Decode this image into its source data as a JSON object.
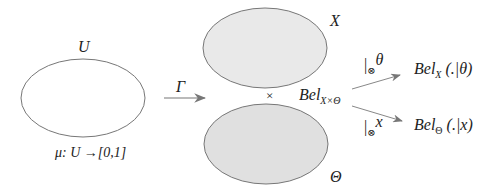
{
  "diagram": {
    "universe": {
      "label": "U",
      "measure": "μ: U →[0,1]"
    },
    "mapping": {
      "label": "Γ"
    },
    "frame_x": {
      "label": "X",
      "fill": "#e9e9e9"
    },
    "frame_theta": {
      "label": "Θ",
      "fill": "#e0e0e0"
    },
    "product_symbol": "×",
    "joint_belief": {
      "base": "Bel",
      "subscript": "X×Θ"
    },
    "conditioning_theta": {
      "operator": "|",
      "sub": "⊗",
      "variable": "θ"
    },
    "conditioning_x": {
      "operator": "|",
      "sub": "⊗",
      "variable": "x"
    },
    "result_x": {
      "base": "Bel",
      "subscript": "X",
      "arg": " (.|θ)"
    },
    "result_theta": {
      "base": "Bel",
      "subscript": "Θ",
      "arg": " (.|x)"
    },
    "stroke_color": "#666666"
  }
}
